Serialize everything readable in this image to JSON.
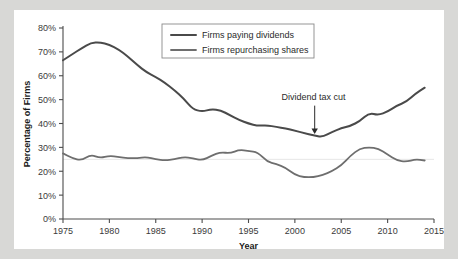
{
  "chart_data": {
    "type": "line",
    "title": "",
    "xlabel": "Year",
    "ylabel": "Percentage of Firms",
    "xlim": [
      1975,
      2015
    ],
    "ylim": [
      0,
      80
    ],
    "xticks": [
      1975,
      1980,
      1985,
      1990,
      1995,
      2000,
      2005,
      2010,
      2015
    ],
    "xtick_labels": [
      "1975",
      "1980",
      "1985",
      "1990",
      "1995",
      "2000",
      "2005",
      "2010",
      "2015"
    ],
    "yticks": [
      0,
      10,
      20,
      30,
      40,
      50,
      60,
      70,
      80
    ],
    "ytick_labels": [
      "0%",
      "10%",
      "20%",
      "30%",
      "40%",
      "50%",
      "60%",
      "70%",
      "80%"
    ],
    "grid": "faint horizontal gridline at 25%",
    "gridlines": [
      25
    ],
    "legend_position": "top-center",
    "x": [
      1975,
      1976,
      1977,
      1978,
      1979,
      1980,
      1981,
      1982,
      1983,
      1984,
      1985,
      1986,
      1987,
      1988,
      1989,
      1990,
      1991,
      1992,
      1993,
      1994,
      1995,
      1996,
      1997,
      1998,
      1999,
      2000,
      2001,
      2002,
      2003,
      2004,
      2005,
      2006,
      2007,
      2008,
      2009,
      2010,
      2011,
      2012,
      2013,
      2014
    ],
    "series": [
      {
        "name": "Firms paying dividends",
        "color": "#4a4a4a",
        "width": 2.0,
        "values": [
          66.5,
          69.0,
          71.5,
          73.8,
          74.0,
          73.0,
          71.0,
          68.0,
          64.5,
          61.5,
          59.5,
          57.0,
          54.0,
          50.5,
          46.0,
          45.0,
          46.0,
          45.5,
          43.5,
          41.5,
          40.0,
          39.0,
          39.3,
          38.5,
          38.0,
          37.0,
          36.0,
          35.0,
          34.3,
          36.5,
          38.0,
          39.0,
          41.0,
          44.5,
          43.5,
          45.0,
          47.5,
          49.0,
          52.5,
          55.0
        ]
      },
      {
        "name": "Firms repurchasing shares",
        "color": "#6e6e6e",
        "width": 1.8,
        "values": [
          27.5,
          25.5,
          24.5,
          27.0,
          25.5,
          26.5,
          26.0,
          25.5,
          25.5,
          26.0,
          25.0,
          24.5,
          25.0,
          26.0,
          25.5,
          24.5,
          26.5,
          28.0,
          27.5,
          29.0,
          28.5,
          28.0,
          24.0,
          23.0,
          21.5,
          18.5,
          17.5,
          17.5,
          18.5,
          20.0,
          22.5,
          26.5,
          29.5,
          30.0,
          29.5,
          27.0,
          24.5,
          24.0,
          25.0,
          24.5
        ]
      }
    ],
    "annotations": [
      {
        "text": "Dividend tax cut",
        "x": 2003,
        "y": 34.3,
        "label_x": 2002,
        "label_y": 50,
        "arrow": "down"
      }
    ]
  }
}
